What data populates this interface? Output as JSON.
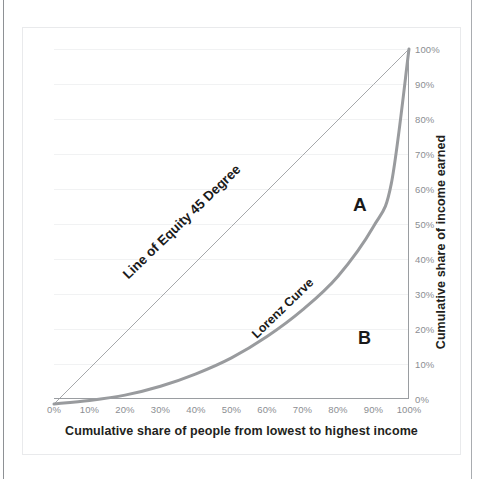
{
  "chart_data": {
    "type": "line",
    "title": "",
    "xlabel": "Cumulative share of people from lowest to highest income",
    "ylabel": "Cumulative share of income earned",
    "xlim": [
      0,
      100
    ],
    "ylim": [
      0,
      100
    ],
    "grid": true,
    "legend": "none",
    "y_axis_position": "right",
    "x_ticks": [
      "0%",
      "10%",
      "20%",
      "30%",
      "40%",
      "50%",
      "60%",
      "70%",
      "80%",
      "90%",
      "100%"
    ],
    "y_ticks": [
      "0%",
      "10%",
      "20%",
      "30%",
      "40%",
      "50%",
      "60%",
      "70%",
      "80%",
      "90%",
      "100%"
    ],
    "x": [
      0,
      10,
      20,
      30,
      40,
      50,
      60,
      70,
      80,
      90,
      95,
      100
    ],
    "series": [
      {
        "name": "Line of Equity 45 Degree",
        "color": "#a6a8ab",
        "width": 1,
        "values": [
          0,
          10,
          20,
          30,
          40,
          50,
          60,
          70,
          80,
          90,
          95,
          100
        ]
      },
      {
        "name": "Lorenz Curve",
        "color": "#999b9e",
        "width": 3,
        "values": [
          0,
          1,
          2.5,
          5,
          8.5,
          13,
          19,
          26.5,
          36,
          50,
          62,
          100
        ]
      }
    ],
    "annotations": [
      {
        "id": "equity-label",
        "text": "Line of Equity 45 Degree",
        "rotation": -44
      },
      {
        "id": "lorenz-label",
        "text": "Lorenz Curve",
        "rotation": -44
      },
      {
        "id": "region-a",
        "text": "A",
        "meaning": "area between line of equity and Lorenz curve"
      },
      {
        "id": "region-b",
        "text": "B",
        "meaning": "area under the Lorenz curve"
      }
    ]
  },
  "axes": {
    "x_title": "Cumulative share of people from lowest to highest income",
    "y_title": "Cumulative share of income earned",
    "x_ticks": [
      "0%",
      "10%",
      "20%",
      "30%",
      "40%",
      "50%",
      "60%",
      "70%",
      "80%",
      "90%",
      "100%"
    ],
    "y_ticks": [
      "0%",
      "10%",
      "20%",
      "30%",
      "40%",
      "50%",
      "60%",
      "70%",
      "80%",
      "90%",
      "100%"
    ]
  },
  "labels": {
    "equity_line": "Line of Equity 45 Degree",
    "lorenz_curve": "Lorenz Curve",
    "region_a": "A",
    "region_b": "B"
  },
  "colors": {
    "lorenz_curve": "#999b9e",
    "equity_line": "#a6a8ab",
    "gridline": "#f1f2f3",
    "axis": "#9a9da1",
    "tick_text": "#8b8e92",
    "title_text": "#231f20"
  }
}
